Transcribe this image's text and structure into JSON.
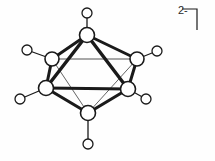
{
  "figure": {
    "name": "closo-hexaborate-dianion-octahedron",
    "background_color": "#fefefe",
    "stroke_color": "#1a1a1a",
    "vertex_fill_color": "#ffffff",
    "charge": {
      "bracket": "⌐",
      "label": "2-",
      "superscript": "2−"
    },
    "geometry": {
      "viewbox": "0 0 215 161",
      "cluster_vertices": [
        {
          "id": "top",
          "name": "vertex-top",
          "cx": 87,
          "cy": 35,
          "r": 7.5
        },
        {
          "id": "back-left",
          "name": "vertex-back-left",
          "cx": 52,
          "cy": 59,
          "r": 7.0
        },
        {
          "id": "back-right",
          "name": "vertex-back-right",
          "cx": 137,
          "cy": 59,
          "r": 7.0
        },
        {
          "id": "front-left",
          "name": "vertex-front-left",
          "cx": 46,
          "cy": 88,
          "r": 7.5
        },
        {
          "id": "front-right",
          "name": "vertex-front-right",
          "cx": 128,
          "cy": 89,
          "r": 7.5
        },
        {
          "id": "bottom",
          "name": "vertex-bottom",
          "cx": 88,
          "cy": 113,
          "r": 7.5
        }
      ],
      "terminal_atoms": [
        {
          "id": "h-top",
          "name": "terminal-atom-top",
          "cx": 87,
          "cy": 13,
          "r": 5.0,
          "from": "top"
        },
        {
          "id": "h-back-left",
          "name": "terminal-atom-back-left",
          "cx": 27,
          "cy": 50,
          "r": 5.0,
          "from": "back-left"
        },
        {
          "id": "h-back-right",
          "name": "terminal-atom-back-right",
          "cx": 157,
          "cy": 51,
          "r": 5.0,
          "from": "back-right"
        },
        {
          "id": "h-front-left",
          "name": "terminal-atom-front-left",
          "cx": 20,
          "cy": 99,
          "r": 5.0,
          "from": "front-left"
        },
        {
          "id": "h-front-right",
          "name": "terminal-atom-front-right",
          "cx": 146,
          "cy": 99,
          "r": 5.0,
          "from": "front-right"
        },
        {
          "id": "h-bottom",
          "name": "terminal-atom-bottom",
          "cx": 88,
          "cy": 144,
          "r": 5.0,
          "from": "bottom"
        }
      ],
      "edges_front": [
        {
          "name": "edge-top-back-left",
          "a": "top",
          "b": "back-left",
          "width": 3.0
        },
        {
          "name": "edge-top-back-right",
          "a": "top",
          "b": "back-right",
          "width": 3.0
        },
        {
          "name": "edge-top-front-left",
          "a": "top",
          "b": "front-left",
          "width": 3.4
        },
        {
          "name": "edge-top-front-right",
          "a": "top",
          "b": "front-right",
          "width": 3.4
        },
        {
          "name": "edge-front-left-front-right",
          "a": "front-left",
          "b": "front-right",
          "width": 3.2
        },
        {
          "name": "edge-front-left-back-left",
          "a": "front-left",
          "b": "back-left",
          "width": 3.0
        },
        {
          "name": "edge-front-right-back-right",
          "a": "front-right",
          "b": "back-right",
          "width": 3.0
        },
        {
          "name": "edge-bottom-front-left",
          "a": "bottom",
          "b": "front-left",
          "width": 3.2
        },
        {
          "name": "edge-bottom-front-right",
          "a": "bottom",
          "b": "front-right",
          "width": 3.2
        }
      ],
      "edges_hidden": [
        {
          "name": "edge-back-left-back-right",
          "a": "back-left",
          "b": "back-right",
          "width": 1.0
        },
        {
          "name": "edge-bottom-back-left",
          "a": "bottom",
          "b": "back-left",
          "width": 0.9
        },
        {
          "name": "edge-bottom-back-right",
          "a": "bottom",
          "b": "back-right",
          "width": 0.9
        }
      ],
      "bonds_terminal": [
        {
          "name": "bond-terminal-top",
          "from": "top",
          "to": "h-top",
          "width": 1.3
        },
        {
          "name": "bond-terminal-back-left",
          "from": "back-left",
          "to": "h-back-left",
          "width": 1.3
        },
        {
          "name": "bond-terminal-back-right",
          "from": "back-right",
          "to": "h-back-right",
          "width": 1.3
        },
        {
          "name": "bond-terminal-front-left",
          "from": "front-left",
          "to": "h-front-left",
          "width": 1.3
        },
        {
          "name": "bond-terminal-front-right",
          "from": "front-right",
          "to": "h-front-right",
          "width": 1.3
        },
        {
          "name": "bond-terminal-bottom",
          "from": "bottom",
          "to": "h-bottom",
          "width": 1.3
        }
      ],
      "bracket": {
        "name": "charge-bracket",
        "points": "182,9 197,9 197,30",
        "width": 1.2
      }
    }
  }
}
